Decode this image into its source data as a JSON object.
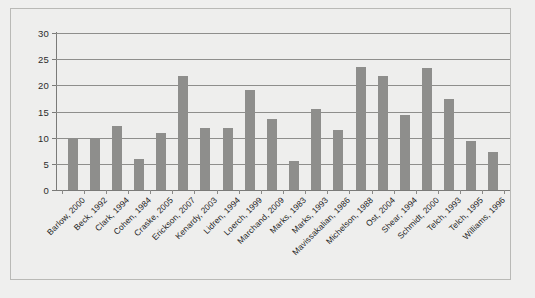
{
  "chart_data": {
    "type": "bar",
    "title": "",
    "subtitle": "",
    "xlabel": "",
    "ylabel": "",
    "ylim": [
      0,
      30
    ],
    "ytick_values": [
      0,
      5,
      10,
      15,
      20,
      25,
      30
    ],
    "ytick_labels": [
      "0",
      "5",
      "10",
      "15",
      "20",
      "25",
      "30"
    ],
    "grid": true,
    "legend": null,
    "legend_position": "none",
    "orientation": "vertical",
    "bar_color": "#8e8e8c",
    "categories": [
      "Barlow, 2000",
      "Beck, 1992",
      "Clark, 1994",
      "Cohen, 1984",
      "Craske, 2005",
      "Erickson, 2007",
      "Kenardy, 2003",
      "Lidren, 1994",
      "Loerch, 1999",
      "Marchand, 2009",
      "Marks, 1983",
      "Marks, 1993",
      "Mavissakalian, 1986",
      "Michelson, 1988",
      "Ost, 2004",
      "Shear, 1994",
      "Schmidt, 2000",
      "Telch, 1993",
      "Telch, 1995",
      "Williams, 1996"
    ],
    "values": [
      9.7,
      10.0,
      12.2,
      5.9,
      10.8,
      21.8,
      11.8,
      11.8,
      19.2,
      13.6,
      5.6,
      15.5,
      11.5,
      23.5,
      21.7,
      14.4,
      23.4,
      17.4,
      9.4,
      7.3
    ]
  },
  "colors": {
    "background": "#efefee",
    "panel": "#eeeeed",
    "panel_border": "#b9b9b6",
    "bar": "#8e8e8c",
    "gridline": "#8e8e8c",
    "axis": "#7a7a78",
    "text": "#1f1f1f"
  }
}
